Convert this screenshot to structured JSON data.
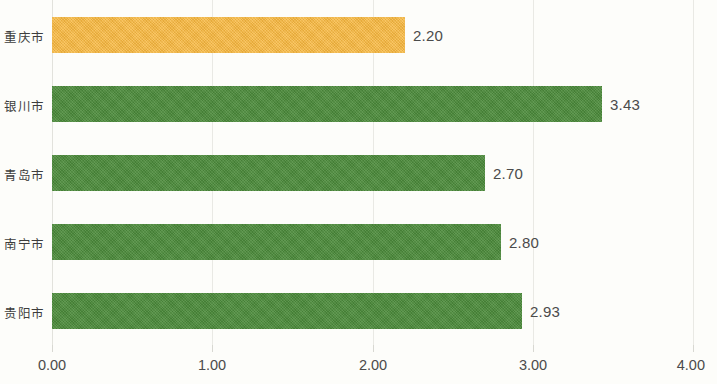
{
  "chart_data": {
    "type": "bar",
    "orientation": "horizontal",
    "title": "",
    "subtitle": "",
    "xlabel": "",
    "ylabel": "",
    "xlim": [
      0.0,
      4.0
    ],
    "xticks": [
      "0.00",
      "1.00",
      "2.00",
      "3.00",
      "4.00"
    ],
    "xtick_values": [
      0,
      1,
      2,
      3,
      4
    ],
    "grid": "vertical",
    "legend": "none",
    "categories": [
      "重庆市",
      "银川市",
      "青岛市",
      "南宁市",
      "贵阳市"
    ],
    "values": [
      2.2,
      3.43,
      2.7,
      2.8,
      2.93
    ],
    "value_labels": [
      "2.20",
      "3.43",
      "2.70",
      "2.80",
      "2.93"
    ],
    "bar_colors": [
      "#f7b73e",
      "#4c8b3b",
      "#4c8b3b",
      "#4c8b3b",
      "#4c8b3b"
    ],
    "highlight_index": 0,
    "colors": {
      "highlight": "#f7b73e",
      "series": "#4c8b3b",
      "gridline": "#e9e9e4",
      "text": "#4b4b4b",
      "background": "#fdfdfa"
    }
  }
}
